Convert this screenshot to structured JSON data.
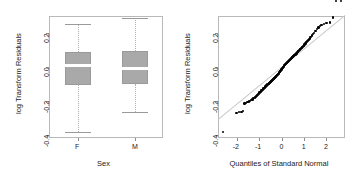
{
  "figure": {
    "background": "#ffffff",
    "point_color": "#000000",
    "box_fill": "#a9a9a9",
    "axis_color": "#8d8d8d",
    "median_color": "#ffffff",
    "qqline_color": "#c9c9c9"
  },
  "chart_data": [
    {
      "type": "box",
      "title": "",
      "xlabel": "Sex",
      "ylabel": "log Transform Residuals",
      "categories": [
        "F",
        "M"
      ],
      "ylim": [
        -0.42,
        0.3
      ],
      "yticks": [
        0.2,
        0.0,
        -0.2,
        -0.4
      ],
      "ytick_labels": [
        "0.2",
        "0.0",
        "-0.2",
        "-0.4"
      ],
      "grid": false,
      "boxes": [
        {
          "category": "F",
          "whisker_low": -0.385,
          "q1": -0.107,
          "median": 0.005,
          "q3": 0.086,
          "whisker_high": 0.255,
          "outliers": []
        },
        {
          "category": "M",
          "whisker_low": -0.265,
          "q1": -0.101,
          "median": -0.008,
          "q3": 0.092,
          "whisker_high": 0.29,
          "outliers": []
        }
      ]
    },
    {
      "type": "scatter",
      "title": "",
      "xlabel": "Quantiles of Standard Normal",
      "ylabel": "log Transform Residuals",
      "xlim": [
        -2.85,
        2.85
      ],
      "ylim": [
        -0.42,
        0.3
      ],
      "xticks": [
        -2,
        -1,
        0,
        1,
        2
      ],
      "xtick_labels": [
        "-2",
        "-1",
        "0",
        "1",
        "2"
      ],
      "yticks": [
        0.2,
        0.0,
        -0.2,
        -0.4
      ],
      "ytick_labels": [
        "0.2",
        "0.0",
        "-0.2",
        "-0.4"
      ],
      "grid": false,
      "reference_line": {
        "intercept": 0.0,
        "slope": 0.108
      },
      "x": [
        -2.62,
        -2.02,
        -1.9,
        -1.8,
        -1.72,
        -1.66,
        -1.58,
        -1.52,
        -1.46,
        -1.41,
        -1.36,
        -1.31,
        -1.27,
        -1.23,
        -1.19,
        -1.15,
        -1.11,
        -1.08,
        -1.04,
        -1.01,
        -0.98,
        -0.95,
        -0.92,
        -0.89,
        -0.86,
        -0.83,
        -0.8,
        -0.77,
        -0.75,
        -0.72,
        -0.69,
        -0.67,
        -0.64,
        -0.62,
        -0.59,
        -0.57,
        -0.54,
        -0.52,
        -0.5,
        -0.47,
        -0.45,
        -0.43,
        -0.4,
        -0.38,
        -0.36,
        -0.34,
        -0.31,
        -0.29,
        -0.27,
        -0.25,
        -0.23,
        -0.21,
        -0.18,
        -0.16,
        -0.14,
        -0.12,
        -0.1,
        -0.08,
        -0.06,
        -0.04,
        -0.02,
        0.0,
        0.02,
        0.04,
        0.06,
        0.08,
        0.1,
        0.12,
        0.14,
        0.16,
        0.18,
        0.21,
        0.23,
        0.25,
        0.27,
        0.29,
        0.31,
        0.34,
        0.36,
        0.38,
        0.4,
        0.43,
        0.45,
        0.47,
        0.5,
        0.52,
        0.54,
        0.57,
        0.59,
        0.62,
        0.64,
        0.67,
        0.69,
        0.72,
        0.75,
        0.77,
        0.8,
        0.83,
        0.86,
        0.89,
        0.92,
        0.95,
        0.98,
        1.01,
        1.04,
        1.08,
        1.11,
        1.15,
        1.19,
        1.23,
        1.27,
        1.31,
        1.36,
        1.41,
        1.46,
        1.52,
        1.58,
        1.66,
        1.72,
        1.8,
        1.9,
        2.02,
        2.18,
        2.32,
        2.45,
        2.68
      ],
      "y": [
        -0.385,
        -0.272,
        -0.268,
        -0.266,
        -0.262,
        -0.216,
        -0.212,
        -0.208,
        -0.205,
        -0.2,
        -0.196,
        -0.192,
        -0.188,
        -0.184,
        -0.18,
        -0.176,
        -0.172,
        -0.168,
        -0.16,
        -0.156,
        -0.152,
        -0.148,
        -0.144,
        -0.14,
        -0.136,
        -0.132,
        -0.128,
        -0.124,
        -0.12,
        -0.116,
        -0.113,
        -0.11,
        -0.107,
        -0.104,
        -0.101,
        -0.098,
        -0.095,
        -0.092,
        -0.089,
        -0.086,
        -0.083,
        -0.08,
        -0.077,
        -0.074,
        -0.071,
        -0.068,
        -0.065,
        -0.062,
        -0.059,
        -0.056,
        -0.053,
        -0.05,
        -0.047,
        -0.044,
        -0.041,
        -0.038,
        -0.034,
        -0.031,
        -0.028,
        -0.024,
        -0.02,
        -0.016,
        -0.012,
        -0.008,
        -0.004,
        0.0,
        0.003,
        0.006,
        0.009,
        0.012,
        0.015,
        0.018,
        0.021,
        0.024,
        0.027,
        0.03,
        0.033,
        0.036,
        0.039,
        0.042,
        0.045,
        0.048,
        0.051,
        0.054,
        0.057,
        0.06,
        0.063,
        0.066,
        0.069,
        0.072,
        0.075,
        0.078,
        0.082,
        0.086,
        0.09,
        0.094,
        0.098,
        0.102,
        0.106,
        0.11,
        0.114,
        0.118,
        0.122,
        0.126,
        0.132,
        0.138,
        0.144,
        0.15,
        0.156,
        0.162,
        0.168,
        0.176,
        0.184,
        0.192,
        0.2,
        0.21,
        0.222,
        0.232,
        0.24,
        0.246,
        0.252,
        0.258,
        0.262,
        0.29
      ]
    }
  ]
}
